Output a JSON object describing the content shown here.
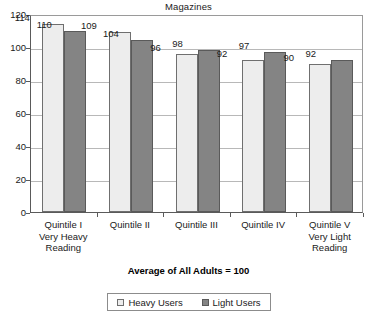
{
  "chart_data": {
    "type": "bar",
    "title": "Magazines",
    "xlabel": "",
    "ylabel": "",
    "ylim": [
      0,
      120
    ],
    "yticks": [
      0,
      20,
      40,
      60,
      80,
      100,
      120
    ],
    "grid": true,
    "legend_position": "bottom",
    "footnote": "Average of All Adults = 100",
    "categories": [
      "Quintile I\nVery Heavy\nReading",
      "Quintile II",
      "Quintile III",
      "Quintile IV",
      "Quintile V\nVery Light\nReading"
    ],
    "category_lines": [
      [
        "Quintile I",
        "Very Heavy",
        "Reading"
      ],
      [
        "Quintile II"
      ],
      [
        "Quintile III"
      ],
      [
        "Quintile IV"
      ],
      [
        "Quintile V",
        "Very Light",
        "Reading"
      ]
    ],
    "series": [
      {
        "name": "Heavy Users",
        "color": "#ededed",
        "values": [
          114,
          109,
          96,
          92,
          90
        ]
      },
      {
        "name": "Light Users",
        "color": "#848484",
        "values": [
          110,
          104,
          98,
          97,
          92
        ]
      }
    ]
  },
  "legend": {
    "items": [
      {
        "label": "Heavy Users",
        "swatch": "heavy"
      },
      {
        "label": "Light Users",
        "swatch": "light"
      }
    ]
  },
  "colors": {
    "heavy_fill": "#ededed",
    "light_fill": "#848484",
    "axis": "#5a5a5a",
    "grid": "#b8b8b8"
  }
}
